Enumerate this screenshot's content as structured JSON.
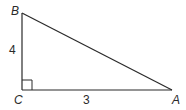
{
  "diagram": {
    "type": "right-triangle",
    "vertices": {
      "A": {
        "label": "A",
        "x": 172,
        "y": 90
      },
      "B": {
        "label": "B",
        "x": 22,
        "y": 13
      },
      "C": {
        "label": "C",
        "x": 22,
        "y": 90
      }
    },
    "sides": {
      "BC": {
        "label": "4"
      },
      "CA": {
        "label": "3"
      }
    },
    "right_angle_at": "C",
    "stroke_color": "#2a2a2a"
  }
}
